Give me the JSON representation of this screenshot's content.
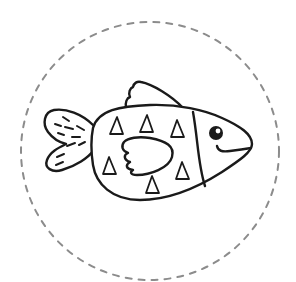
{
  "illustration": {
    "subject": "fish",
    "style": "black line art coloring page",
    "colors": {
      "background": "#ffffff",
      "outline": "#1a1a1a",
      "dashed_circle": "#8c8c8c"
    },
    "frame": {
      "shape": "dashed-circle",
      "center": [
        150,
        151
      ],
      "radius": 129
    },
    "parts": [
      "body",
      "tail-fin",
      "dorsal-fin",
      "side-fin",
      "head-divider",
      "eye",
      "smile",
      "triangle-scales"
    ],
    "triangle_scale_count": 7,
    "tail_stripe_count": 10
  }
}
